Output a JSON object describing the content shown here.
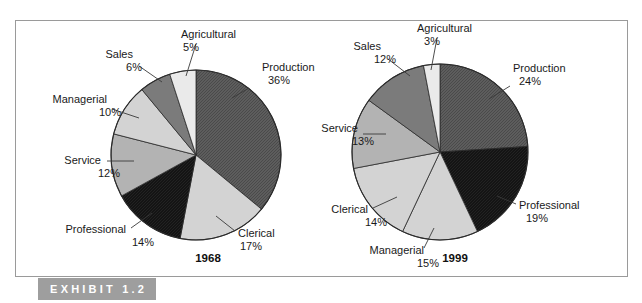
{
  "figure": {
    "exhibit_label": "EXHIBIT 1.2",
    "band_color": "#9e9e9e",
    "frame_color": "#9a9a9a",
    "background": "#ffffff"
  },
  "chart_data": [
    {
      "type": "pie",
      "title": "1968",
      "year_label": "1968",
      "categories": [
        "Production",
        "Clerical",
        "Professional",
        "Service",
        "Managerial",
        "Sales",
        "Agricultural"
      ],
      "values": [
        36,
        17,
        14,
        12,
        10,
        6,
        5
      ],
      "labels": [
        {
          "name": "Production",
          "pct": "36%",
          "text_x": 262,
          "text_y": 71,
          "pct_x": 279,
          "pct_y": 84,
          "anchor": "start",
          "lx1": 249,
          "ly1": 88,
          "lx2": 232,
          "ly2": 98
        },
        {
          "name": "Clerical",
          "pct": "17%",
          "text_x": 238,
          "text_y": 237,
          "pct_x": 251,
          "pct_y": 250,
          "anchor": "start",
          "lx1": 235,
          "ly1": 231,
          "lx2": 216,
          "ly2": 216
        },
        {
          "name": "Professional",
          "pct": "14%",
          "text_x": 126,
          "text_y": 233,
          "pct_x": 143,
          "pct_y": 246,
          "anchor": "end",
          "lx1": 131,
          "ly1": 228,
          "lx2": 152,
          "ly2": 213
        },
        {
          "name": "Service",
          "pct": "12%",
          "text_x": 101,
          "text_y": 164,
          "pct_x": 109,
          "pct_y": 177,
          "anchor": "end",
          "lx1": 107,
          "ly1": 161,
          "lx2": 134,
          "ly2": 161
        },
        {
          "name": "Managerial",
          "pct": "10%",
          "text_x": 107,
          "text_y": 103,
          "pct_x": 110,
          "pct_y": 116,
          "anchor": "end",
          "lx1": 112,
          "ly1": 109,
          "lx2": 139,
          "ly2": 118
        },
        {
          "name": "Sales",
          "pct": "6%",
          "text_x": 133,
          "text_y": 58,
          "pct_x": 134,
          "pct_y": 71,
          "anchor": "end",
          "lx1": 139,
          "ly1": 66,
          "lx2": 162,
          "ly2": 82
        },
        {
          "name": "Agricultural",
          "pct": "5%",
          "text_x": 181,
          "text_y": 38,
          "pct_x": 191,
          "pct_y": 51,
          "anchor": "start",
          "lx1": 196,
          "ly1": 44,
          "lx2": 186,
          "ly2": 76
        }
      ]
    },
    {
      "type": "pie",
      "title": "1999",
      "year_label": "1999",
      "categories": [
        "Production",
        "Professional",
        "Clerical",
        "Managerial",
        "Service",
        "Sales",
        "Agricultural"
      ],
      "values": [
        24,
        19,
        14,
        15,
        13,
        12,
        3
      ],
      "labels": [
        {
          "name": "Production",
          "pct": "24%",
          "text_x": 513,
          "text_y": 72,
          "pct_x": 530,
          "pct_y": 85,
          "anchor": "start",
          "lx1": 510,
          "ly1": 86,
          "lx2": 489,
          "ly2": 99
        },
        {
          "name": "Professional",
          "pct": "19%",
          "text_x": 519,
          "text_y": 209,
          "pct_x": 537,
          "pct_y": 222,
          "anchor": "start",
          "lx1": 516,
          "ly1": 204,
          "lx2": 497,
          "ly2": 196
        },
        {
          "name": "Clerical",
          "pct": "14%",
          "text_x": 368,
          "text_y": 213,
          "pct_x": 376,
          "pct_y": 226,
          "anchor": "end",
          "lx1": 373,
          "ly1": 208,
          "lx2": 397,
          "ly2": 197
        },
        {
          "name": "Managerial",
          "pct": "15%",
          "text_x": 424,
          "text_y": 254,
          "pct_x": 428,
          "pct_y": 267,
          "anchor": "end",
          "lx1": 424,
          "ly1": 248,
          "lx2": 434,
          "ly2": 228
        },
        {
          "name": "Service",
          "pct": "13%",
          "text_x": 358,
          "text_y": 132,
          "pct_x": 363,
          "pct_y": 145,
          "anchor": "end",
          "lx1": 363,
          "ly1": 134,
          "lx2": 386,
          "ly2": 134
        },
        {
          "name": "Sales",
          "pct": "12%",
          "text_x": 381,
          "text_y": 50,
          "pct_x": 385,
          "pct_y": 63,
          "anchor": "end",
          "lx1": 388,
          "ly1": 59,
          "lx2": 410,
          "ly2": 76
        },
        {
          "name": "Agricultural",
          "pct": "3%",
          "text_x": 417,
          "text_y": 32,
          "pct_x": 432,
          "pct_y": 45,
          "anchor": "start",
          "lx1": 437,
          "ly1": 38,
          "lx2": 431,
          "ly2": 70
        }
      ]
    }
  ],
  "pies": {
    "left": {
      "cx": 196,
      "cy": 155,
      "r": 85,
      "year_x": 208,
      "year_y": 262
    },
    "right": {
      "cx": 440,
      "cy": 152,
      "r": 88,
      "year_x": 455,
      "year_y": 262
    }
  },
  "slice_styles": {
    "Production": "hatch-dark",
    "Clerical": "light-gray",
    "Professional": "black",
    "Service": "mid-gray",
    "Managerial": "light-gray",
    "Sales": "dark-gray",
    "Agricultural": "very-light"
  },
  "colors": {
    "hatch-dark": "#5a5a5a",
    "light-gray": "#d3d3d3",
    "black": "#151515",
    "mid-gray": "#b3b3b3",
    "dark-gray": "#7b7b7b",
    "very-light": "#eaeaea"
  }
}
